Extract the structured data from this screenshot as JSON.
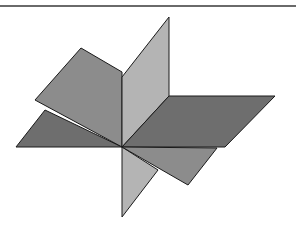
{
  "figure": {
    "colors": {
      "horizontal_plane": "#6e6e6e",
      "slanted_plane": "#8c8c8c",
      "vertical_plane": "#b4b4b4",
      "edge": "#1a1a1a",
      "top_rule": "#6a6a6a",
      "background": "#ffffff"
    },
    "center": [
      122,
      147
    ],
    "faces": {
      "horizontal_left": "16,147 122,147 45,110",
      "horizontal_right": "122,147 225,147 275,96 169,96",
      "slanted_left_upper": "35,100 81,48 122,72 122,147",
      "slanted_right_lower": "122,147 217,148 188,185",
      "vertical_upper": "122,77 169,17 169,96 122,147",
      "vertical_lower": "122,147 158,170 122,217"
    }
  }
}
